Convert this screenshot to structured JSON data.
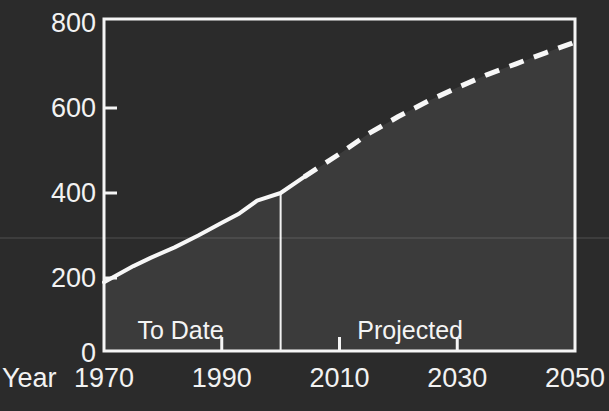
{
  "chart_data": {
    "type": "line",
    "title": "",
    "xlabel": "Year",
    "ylabel": "",
    "xlim": [
      1970,
      2050
    ],
    "ylim": [
      0,
      800
    ],
    "xticks": [
      1970,
      1990,
      2010,
      2030,
      2050
    ],
    "xtick_labels": [
      "1970",
      "1990",
      "2010",
      "2030",
      "2050"
    ],
    "yticks": [
      0,
      200,
      400,
      600,
      800
    ],
    "ytick_labels": [
      "0",
      "200",
      "400",
      "600",
      "800"
    ],
    "grid": false,
    "legend": "none",
    "background_color": "#2b2b2b",
    "fill_color": "#3b3b3b",
    "line_color": "#f5f5f5",
    "axis_color": "#f5f5f5",
    "text_color": "#f2f2f2",
    "divider_year": 2000,
    "series": [
      {
        "name": "To Date",
        "style": "solid",
        "x": [
          1970,
          1975,
          1978,
          1982,
          1986,
          1990,
          1993,
          1996,
          2000,
          2004
        ],
        "values": [
          190,
          228,
          248,
          272,
          300,
          330,
          352,
          382,
          400,
          438
        ]
      },
      {
        "name": "Projected",
        "style": "dashed",
        "x": [
          2004,
          2010,
          2015,
          2020,
          2025,
          2030,
          2035,
          2040,
          2045,
          2050
        ],
        "values": [
          438,
          492,
          540,
          580,
          616,
          648,
          678,
          704,
          730,
          755
        ]
      }
    ],
    "annotations": [
      {
        "text": "To Date",
        "x": 1983,
        "y": 78
      },
      {
        "text": "Projected",
        "x": 2022,
        "y": 78
      }
    ]
  },
  "axis": {
    "year_label": "Year"
  }
}
